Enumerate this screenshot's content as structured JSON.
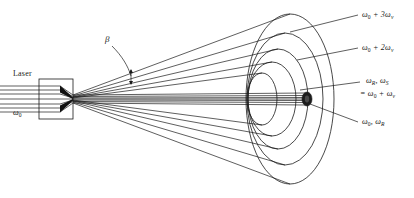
{
  "figure": {
    "type": "optical-ray-diagram",
    "background": "#ffffff",
    "line_color": "#1a1a1a",
    "fill_dark": "#111111"
  },
  "source": {
    "label": "Laser",
    "beam_label": "ω",
    "beam_label_sub": "0"
  },
  "angle": {
    "symbol": "β"
  },
  "rings": [
    {
      "id": "ring-outer",
      "label_prefix": "ω",
      "label_sub": "0",
      "label_rest": " + 3ω",
      "label_rest_sub": "v",
      "text": "ω0 + 3ωv"
    },
    {
      "id": "ring-second",
      "label_prefix": "ω",
      "label_sub": "0",
      "label_rest": " + 2ω",
      "label_rest_sub": "v",
      "text": "ω0 + 2ωv"
    },
    {
      "id": "ring-third",
      "line1_a": "ω",
      "line1_a_sub": "R",
      "line1_b": ", ω",
      "line1_b_sub": "S",
      "line2_a": "= ω",
      "line2_a_sub": "0",
      "line2_b": " + ω",
      "line2_b_sub": "v",
      "text": "ωR, ωS = ω0 + ωv"
    },
    {
      "id": "ring-inner",
      "label_a": "ω",
      "label_a_sub": "0",
      "label_b": ", ω",
      "label_b_sub": "R",
      "text": "ω0, ωR"
    }
  ]
}
